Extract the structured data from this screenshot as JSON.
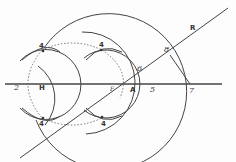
{
  "diagram": {
    "type": "geometric-construction",
    "stroke_color": "#444444",
    "background": "#fdfdfd",
    "labels": {
      "H": "H",
      "two": "2",
      "four_top_left": "4",
      "four_top_right": "4",
      "four_bottom_left": "4",
      "four_bottom_right": "4",
      "F": "F",
      "A": "A",
      "five": "5",
      "six": "6",
      "seven": "7",
      "eight": "8",
      "R": "R"
    },
    "points": {
      "H": [
        43,
        84
      ],
      "F": [
        112,
        84
      ],
      "A": [
        131,
        84
      ],
      "five": [
        150,
        84
      ],
      "six": [
        146,
        67
      ],
      "seven": [
        190,
        84
      ],
      "eight": [
        175,
        52
      ],
      "R": [
        200,
        30
      ]
    },
    "lines": [
      {
        "name": "baseline",
        "from": [
          5,
          84
        ],
        "to": [
          222,
          84
        ]
      },
      {
        "name": "diagonal-R",
        "from": [
          20,
          158
        ],
        "to": [
          228,
          8
        ]
      }
    ],
    "circles": [
      {
        "name": "circle-H",
        "center": [
          43,
          84
        ],
        "radius": 35,
        "style": "solid"
      },
      {
        "name": "circle-big-F",
        "center": [
          112,
          84
        ],
        "radius": 78,
        "style": "solid"
      },
      {
        "name": "circle-A",
        "center": [
          116,
          84
        ],
        "radius": 34,
        "style": "solid"
      }
    ]
  }
}
